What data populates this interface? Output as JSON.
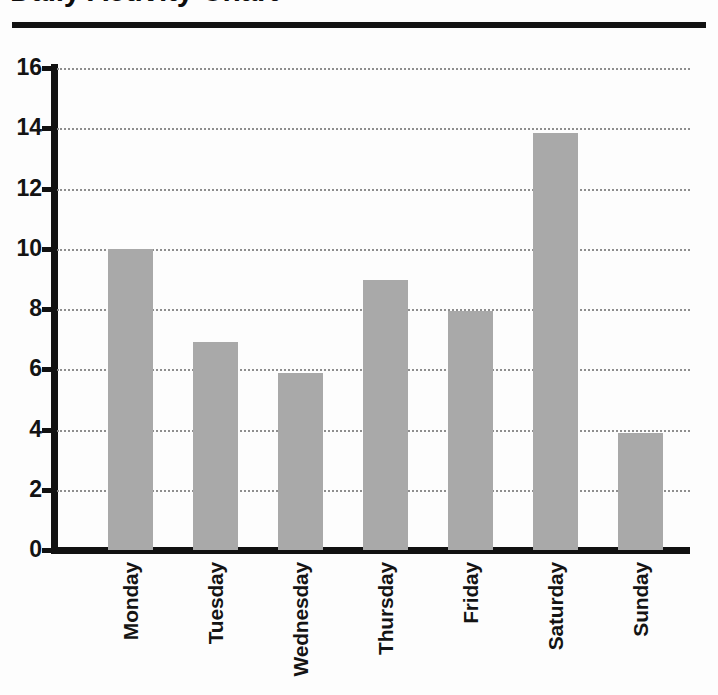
{
  "header": {
    "title": "Daily Activity Chart",
    "rule_color": "#121212"
  },
  "chart_data": {
    "type": "bar",
    "title": "Daily Activity Chart",
    "xlabel": "",
    "ylabel": "",
    "categories": [
      "Monday",
      "Tuesday",
      "Wednesday",
      "Thursday",
      "Friday",
      "Saturday",
      "Sunday"
    ],
    "values": [
      10.0,
      6.9,
      5.87,
      8.95,
      7.95,
      13.85,
      3.87
    ],
    "ylim": [
      0,
      16
    ],
    "ytick_labels": [
      "16",
      "14",
      "12",
      "10",
      "8",
      "6",
      "4",
      "2",
      "0"
    ],
    "ytick_values": [
      16,
      14,
      12,
      10,
      8,
      6,
      4,
      2,
      0
    ],
    "ytick_step": 2,
    "grid": "horizontal-dotted",
    "legend": "none",
    "bar_color": "#a9a9a9",
    "axis_color": "#111111",
    "gridline_color": "#8e8e8e"
  }
}
